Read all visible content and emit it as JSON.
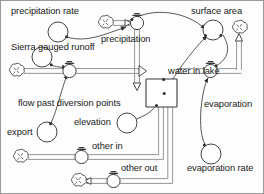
{
  "diagram": {
    "type": "system-dynamics-stock-and-flow",
    "colors": {
      "stroke": "#3a3a3a",
      "pipe": "#808080",
      "text": "#1a1a1a",
      "background": "#fdfdfd",
      "border": "#9a9a9a"
    },
    "stock": {
      "name": "water in lake",
      "label": "water in lake"
    },
    "flows": [
      {
        "id": "precipitation",
        "label": "precipitation",
        "direction": "inflow"
      },
      {
        "id": "flow-past-diversion-points",
        "label": "flow past diversion points",
        "direction": "inflow"
      },
      {
        "id": "evaporation",
        "label": "evaporation",
        "direction": "outflow"
      },
      {
        "id": "other-in",
        "label": "other in",
        "direction": "inflow"
      },
      {
        "id": "other-out",
        "label": "other out",
        "direction": "outflow"
      }
    ],
    "converters": [
      {
        "id": "precipitation-rate",
        "label": "precipitation rate"
      },
      {
        "id": "sierra-gauged-runoff",
        "label": "Sierra gauged runoff"
      },
      {
        "id": "export",
        "label": "export"
      },
      {
        "id": "elevation",
        "label": "elevation"
      },
      {
        "id": "surface-area",
        "label": "surface area"
      },
      {
        "id": "evaporation-rate",
        "label": "evaporation rate"
      }
    ],
    "labels": {
      "precipitation_rate": "precipitation rate",
      "precipitation": "precipitation",
      "sierra_gauged_runoff": "Sierra gauged runoff",
      "flow_past_diversion_points": "flow past diversion points",
      "export": "export",
      "elevation": "elevation",
      "water_in_lake": "water in lake",
      "surface_area": "surface area",
      "evaporation": "evaporation",
      "evaporation_rate": "evaporation rate",
      "other_in": "other in",
      "other_out": "other out"
    }
  }
}
